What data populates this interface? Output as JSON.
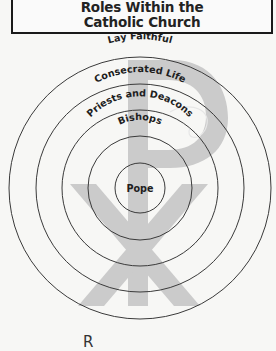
{
  "title": {
    "line1": "Roles Within the",
    "line2": "Catholic Church"
  },
  "diagram": {
    "type": "concentric-circles",
    "center": [
      140,
      188
    ],
    "watermark": "chi-rho-symbol",
    "watermark_color": "#cccccc",
    "stroke_color": "#333333",
    "rings": [
      {
        "label": "Lay Faithful",
        "radius": 131
      },
      {
        "label": "Consecrated Life",
        "radius": 104
      },
      {
        "label": "Priests and Deacons",
        "radius": 78
      },
      {
        "label": "Bishops",
        "radius": 52
      },
      {
        "label": "Pope",
        "radius": 25
      }
    ]
  },
  "footer": {
    "partial_letter": "R"
  }
}
